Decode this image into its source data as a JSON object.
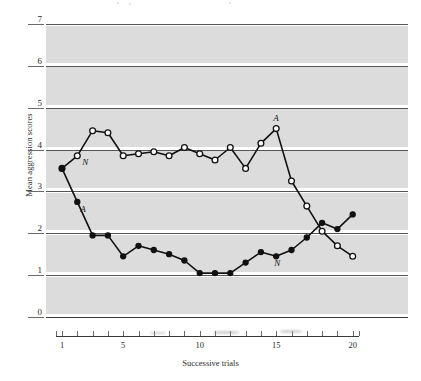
{
  "chart_data": {
    "type": "line",
    "title": "",
    "xlabel": "Successive trials",
    "ylabel": "Mean aggression scores",
    "xlim": [
      0,
      20.6
    ],
    "ylim": [
      0,
      7
    ],
    "ytick_labels": [
      "0",
      "1",
      "2",
      "3",
      "4",
      "5",
      "6",
      "7"
    ],
    "ytick_values": [
      0,
      1,
      2,
      3,
      4,
      5,
      6,
      7
    ],
    "xtick_values": [
      1,
      2,
      3,
      4,
      5,
      6,
      7,
      8,
      9,
      10,
      11,
      12,
      13,
      14,
      15,
      16,
      17,
      18,
      19,
      20
    ],
    "xtick_labeled": [
      1,
      5,
      10,
      15,
      20
    ],
    "xtick_labels": [
      "1",
      "5",
      "10",
      "15",
      "20"
    ],
    "grid": "horizontal-integer-lines-with-alternating-gray-bands",
    "legend": "inline-curve-labels",
    "x": [
      1,
      2,
      3,
      4,
      5,
      6,
      7,
      8,
      9,
      10,
      11,
      12,
      13,
      14,
      15,
      16,
      17,
      18,
      19,
      20
    ],
    "series": [
      {
        "name": "N",
        "marker": "open-circle",
        "label_start": "N",
        "label_end": "A",
        "values": [
          3.55,
          3.85,
          4.45,
          4.4,
          3.85,
          3.9,
          3.95,
          3.85,
          4.05,
          3.9,
          3.75,
          4.05,
          3.55,
          4.15,
          4.5,
          3.25,
          2.65,
          2.05,
          1.7,
          1.45
        ]
      },
      {
        "name": "A",
        "marker": "filled-circle",
        "label_start": "A",
        "label_end": "N",
        "values": [
          3.55,
          2.75,
          1.95,
          1.95,
          1.45,
          1.7,
          1.6,
          1.5,
          1.35,
          1.05,
          1.05,
          1.05,
          1.3,
          1.55,
          1.45,
          1.6,
          1.9,
          2.25,
          2.1,
          2.45
        ]
      }
    ],
    "series_tail": {
      "note": "curves cross near trial 14-15",
      "N_tail": [
        2.05,
        1.7,
        1.45,
        1.25,
        1.05
      ],
      "A_tail": [
        2.25,
        2.1,
        2.45,
        2.45
      ]
    },
    "annotations": [
      {
        "text": "N",
        "near_series": "N",
        "position": "start"
      },
      {
        "text": "A",
        "near_series": "A",
        "position": "start"
      },
      {
        "text": "A",
        "near_series": "N",
        "position": "peak"
      },
      {
        "text": "N",
        "near_series": "A",
        "position": "trough"
      }
    ]
  },
  "colors": {
    "band": "#dcdcdc",
    "gridline": "#555555",
    "axis": "#3a3a3a",
    "line": "#111111",
    "marker_fill_open": "#ffffff",
    "marker_fill_closed": "#111111",
    "text": "#2b2b2b",
    "page": "#ffffff"
  }
}
